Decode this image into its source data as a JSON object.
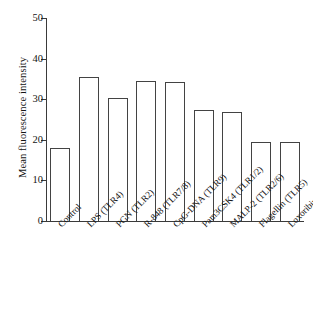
{
  "chart_data": {
    "type": "bar",
    "title": "",
    "xlabel": "",
    "ylabel": "Mean fluorescence intensity",
    "ylim": [
      0,
      50
    ],
    "yticks": [
      0,
      10,
      20,
      30,
      40,
      50
    ],
    "grid": false,
    "legend": null,
    "categories": [
      "Control",
      "LPS (TLR4)",
      "PGN (TLR2)",
      "R-848 (TLR7/8)",
      "CpG-DNA (TLR9)",
      "Pam3CSK4 (TLR1/2)",
      "MALP-2 (TLR2/6)",
      "Flagellin (TLR5)",
      "Loxoribine (TLR7)"
    ],
    "values": [
      18.0,
      35.5,
      30.3,
      34.5,
      34.3,
      27.3,
      26.8,
      19.5,
      19.5
    ],
    "bar_style": {
      "fill": "#ffffff",
      "edge": "#434343"
    }
  }
}
